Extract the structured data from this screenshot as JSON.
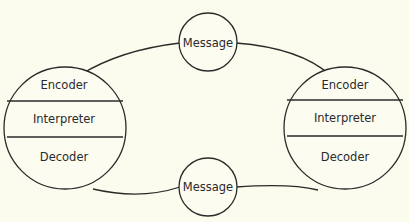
{
  "diagram": {
    "left_node": {
      "sections": [
        "Encoder",
        "Interpreter",
        "Decoder"
      ]
    },
    "right_node": {
      "sections": [
        "Encoder",
        "Interpreter",
        "Decoder"
      ]
    },
    "top_message": {
      "label": "Message"
    },
    "bottom_message": {
      "label": "Message"
    }
  },
  "colors": {
    "background": "#fbfbee",
    "stroke": "#2a2a2a"
  }
}
